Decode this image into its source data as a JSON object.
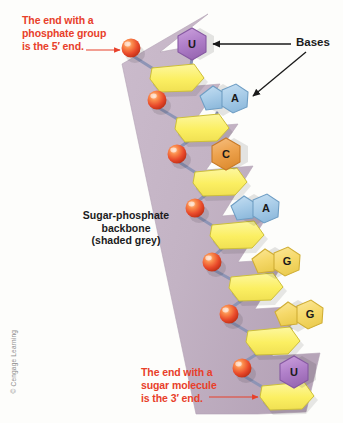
{
  "figure": {
    "background_color": "#fdfdfb"
  },
  "annotations": {
    "five_prime": {
      "text": "The end with a\nphosphate group\nis the 5′ end.",
      "color": "#e8402a"
    },
    "three_prime": {
      "text": "The end with a\nsugar molecule\nis the 3′ end.",
      "color": "#e8402a"
    },
    "bases_label": {
      "text": "Bases",
      "color": "#1b1b1b"
    },
    "backbone_label": {
      "text": "Sugar-phosphate\nbackbone\n(shaded grey)",
      "color": "#1b1b1b"
    },
    "copyright": {
      "text": "© Cengage Learning",
      "color": "#8d8d8d"
    }
  },
  "colors": {
    "ribbon": "#c3b3c4",
    "ribbon_edge": "#b3a2b6",
    "phosphate": "#e8492a",
    "phosphate_highlight": "#ffb08a",
    "sugar": "#fbf06a",
    "sugar_edge": "#cdbf3a",
    "bond": "#8b93b5",
    "purple_base": "#b07fc9",
    "purple_base_edge": "#8659a2",
    "blue_base": "#a8cce8",
    "blue_base_edge": "#6f9ec4",
    "orange_base": "#eda24d",
    "orange_base_edge": "#c77a28",
    "gold_base": "#f6d96a",
    "gold_base_edge": "#d0ae35",
    "arrow_black": "#1a1a1a",
    "arrow_red": "#e8402a"
  },
  "structure": {
    "description": "Single RNA strand: alternating phosphate and sugar units forming a 5' to 3' backbone with attached nitrogenous bases.",
    "nucleotides": [
      {
        "index": 1,
        "base_letter": "U",
        "base_name": "uracil",
        "base_type": "pyrimidine",
        "base_shape": "hexagon",
        "base_color": "#b07fc9",
        "phosphate": {
          "x": 131,
          "y": 48
        },
        "sugar": {
          "x": 174,
          "y": 78
        },
        "base": {
          "x": 192,
          "y": 45
        }
      },
      {
        "index": 2,
        "base_letter": "A",
        "base_name": "adenine",
        "base_type": "purine",
        "base_shape": "fused-pentagon-hexagon",
        "base_color": "#a8cce8",
        "phosphate": {
          "x": 157,
          "y": 100
        },
        "sugar": {
          "x": 199,
          "y": 128
        },
        "base": {
          "x": 225,
          "y": 99
        }
      },
      {
        "index": 3,
        "base_letter": "C",
        "base_name": "cytosine",
        "base_type": "pyrimidine",
        "base_shape": "hexagon",
        "base_color": "#eda24d",
        "phosphate": {
          "x": 177,
          "y": 154
        },
        "sugar": {
          "x": 217,
          "y": 182
        },
        "base": {
          "x": 226,
          "y": 155
        }
      },
      {
        "index": 4,
        "base_letter": "A",
        "base_name": "adenine",
        "base_type": "purine",
        "base_shape": "fused-pentagon-hexagon",
        "base_color": "#a8cce8",
        "phosphate": {
          "x": 195,
          "y": 208
        },
        "sugar": {
          "x": 234,
          "y": 235
        },
        "base": {
          "x": 256,
          "y": 209
        }
      },
      {
        "index": 5,
        "base_letter": "G",
        "base_name": "guanine",
        "base_type": "purine",
        "base_shape": "fused-pentagon-hexagon",
        "base_color": "#f6d96a",
        "phosphate": {
          "x": 212,
          "y": 262
        },
        "sugar": {
          "x": 253,
          "y": 287
        },
        "base": {
          "x": 277,
          "y": 262
        }
      },
      {
        "index": 6,
        "base_letter": "G",
        "base_name": "guanine",
        "base_type": "purine",
        "base_shape": "fused-pentagon-hexagon",
        "base_color": "#f6d96a",
        "phosphate": {
          "x": 229,
          "y": 314
        },
        "sugar": {
          "x": 270,
          "y": 341
        },
        "base": {
          "x": 300,
          "y": 315
        }
      },
      {
        "index": 7,
        "base_letter": "U",
        "base_name": "uracil",
        "base_type": "pyrimidine",
        "base_shape": "hexagon",
        "base_color": "#b07fc9",
        "phosphate": {
          "x": 242,
          "y": 368
        },
        "sugar": {
          "x": 284,
          "y": 396
        },
        "base": {
          "x": 294,
          "y": 373
        }
      }
    ],
    "base_sequence": [
      "U",
      "A",
      "C",
      "A",
      "G",
      "G",
      "U"
    ],
    "ends": {
      "top": "5′ end (phosphate group)",
      "bottom": "3′ end (sugar molecule)"
    }
  }
}
